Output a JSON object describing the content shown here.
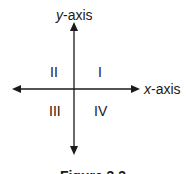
{
  "diagram": {
    "axes": {
      "y_label_var": "y",
      "y_label_suffix": "-axis",
      "x_label_var": "x",
      "x_label_suffix": "-axis"
    },
    "quadrants": [
      {
        "id": "I",
        "label": "I"
      },
      {
        "id": "II",
        "label": "II"
      },
      {
        "id": "III",
        "label": "III"
      },
      {
        "id": "IV",
        "label": "IV"
      }
    ],
    "caption": "Figure 3.3",
    "colors": {
      "stroke": "#1a1a1a",
      "background": "#ffffff"
    }
  }
}
